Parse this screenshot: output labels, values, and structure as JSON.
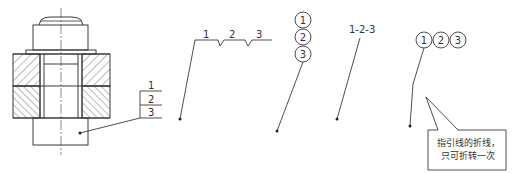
{
  "diagram": {
    "colors": {
      "line": "#3a3a3a",
      "hatch": "#555555",
      "background": "#ffffff"
    },
    "example_stacked_table": {
      "labels": [
        "1",
        "2",
        "3"
      ]
    },
    "example_horizontal_bends": {
      "labels": [
        "1",
        "2",
        "3"
      ]
    },
    "example_vertical_circles": {
      "labels": [
        "1",
        "2",
        "3"
      ]
    },
    "example_dashed_text": {
      "label": "1-2-3"
    },
    "example_horizontal_circles": {
      "labels": [
        "1",
        "2",
        "3"
      ]
    },
    "callout": {
      "line1": "指引线的折线，",
      "line2": "只可折转一次"
    }
  }
}
